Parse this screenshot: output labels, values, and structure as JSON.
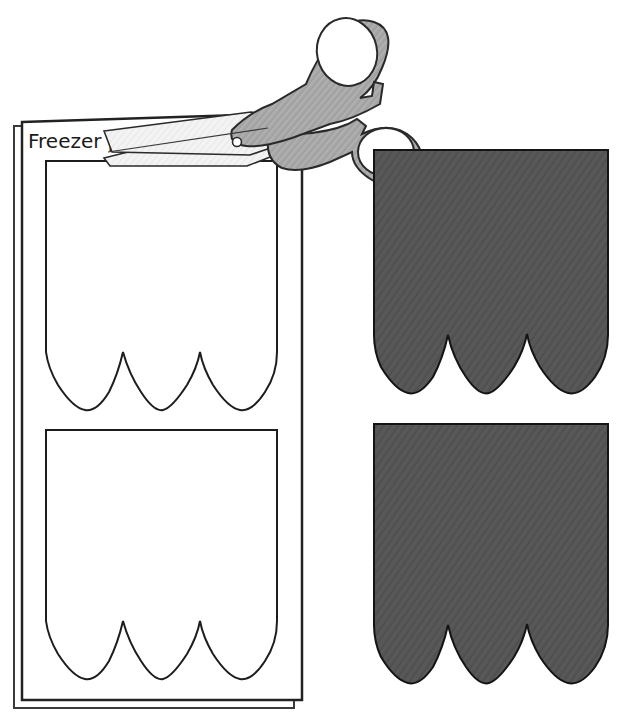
{
  "illustration": {
    "title": "Freezer paper template cutting diagram",
    "background_color": "#ffffff",
    "labels": [
      {
        "id": "freezer-paper",
        "text": "Freezer paper",
        "x": 28,
        "y": 145,
        "font_size": 20,
        "color": "#1a1a1a"
      }
    ],
    "paper_sheet": {
      "name": "freezer-paper-sheet",
      "fill": "#ffffff",
      "stroke": "#222222",
      "stroke_width": 2,
      "fold_stroke": "#3a3a3a",
      "x": 22,
      "y": 118,
      "width": 280,
      "height": 582,
      "fold_offset": 8
    },
    "paper_templates": [
      {
        "name": "paper-template-top",
        "fill": "#ffffff",
        "stroke": "#1d1d1d",
        "stroke_width": 2,
        "x": 46,
        "y": 161,
        "width": 231,
        "height": 249,
        "corner_radius": 22,
        "scallop_count": 3,
        "scallop_depth": 58
      },
      {
        "name": "paper-template-bottom",
        "fill": "#ffffff",
        "stroke": "#1d1d1d",
        "stroke_width": 2,
        "x": 46,
        "y": 430,
        "width": 231,
        "height": 249,
        "corner_radius": 22,
        "scallop_count": 3,
        "scallop_depth": 58
      }
    ],
    "fabric_pieces": [
      {
        "name": "fabric-piece-top",
        "fill": "#555555",
        "stroke": "#141414",
        "stroke_width": 2,
        "texture": "diagonal-weave",
        "x": 374,
        "y": 150,
        "width": 234,
        "height": 243,
        "corner_radius": 22,
        "scallop_count": 3,
        "scallop_depth": 58
      },
      {
        "name": "fabric-piece-bottom",
        "fill": "#555555",
        "stroke": "#141414",
        "stroke_width": 2,
        "texture": "diagonal-weave",
        "x": 374,
        "y": 424,
        "width": 234,
        "height": 259,
        "corner_radius": 22,
        "scallop_count": 3,
        "scallop_depth": 58
      }
    ],
    "scissors": {
      "name": "scissors",
      "handle_fill": "#a8a8a8",
      "handle_stroke": "#2a2a2a",
      "blade_fill": "#f2f2f2",
      "blade_stroke": "#2a2a2a",
      "pivot_fill": "#ffffff",
      "pivot_stroke": "#2a2a2a",
      "pivot_x": 237,
      "pivot_y": 142,
      "pivot_radius": 4,
      "upper_loop": {
        "cx": 345,
        "cy": 52,
        "rx": 30,
        "ry": 34
      },
      "lower_loop": {
        "cx": 385,
        "cy": 150,
        "rx": 31,
        "ry": 28
      },
      "blade_tip_x": 104,
      "blade_tip_y": 131
    }
  }
}
